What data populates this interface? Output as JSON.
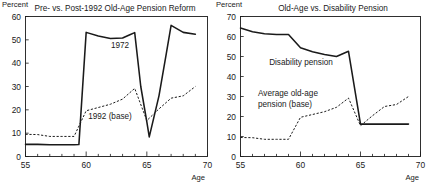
{
  "figure": {
    "ylabel_left": "Percent",
    "ylabel_right": "Percent",
    "xlabel_left": "Age",
    "xlabel_right": "Age"
  },
  "chart_data": [
    {
      "type": "line",
      "title": "Pre- vs. Post-1992 Old-Age Pension Reform",
      "xlabel": "Age",
      "ylabel": "Percent",
      "xlim": [
        55,
        70
      ],
      "ylim": [
        0,
        60
      ],
      "xticks": [
        55,
        60,
        65,
        70
      ],
      "xtick_labels": [
        "55",
        "60",
        "65",
        "70"
      ],
      "xminor_step": 1,
      "yticks": [
        0,
        10,
        20,
        30,
        40,
        50,
        60
      ],
      "ytick_labels": [
        "0",
        "10",
        "20",
        "30",
        "40",
        "50",
        "60"
      ],
      "grid": false,
      "legend_position": "inline-annotation",
      "series": [
        {
          "name": "1972",
          "style": "dashed",
          "label_text": "1972",
          "x": [
            55,
            56,
            57,
            58,
            59,
            59.4,
            60,
            61,
            62,
            63,
            63.6,
            64,
            64.5,
            65,
            65.2,
            66,
            66.6,
            67,
            68,
            69
          ],
          "values": [
            5.2,
            5.2,
            5.0,
            5.0,
            5.0,
            5.1,
            53.2,
            51.6,
            50.6,
            50.8,
            52.2,
            53.1,
            30.0,
            14.8,
            8.4,
            26.0,
            44.0,
            56.2,
            53.2,
            52.4
          ]
        },
        {
          "name": "1992 (base)",
          "style": "solid",
          "label_text": "1992 (base)",
          "x": [
            55,
            56,
            57,
            58,
            59,
            60,
            61,
            62,
            63,
            64,
            65,
            66,
            67,
            68,
            69
          ],
          "values": [
            9.5,
            9.4,
            8.6,
            8.6,
            8.6,
            19.6,
            21.0,
            22.4,
            24.6,
            29.2,
            15.4,
            20.4,
            25.0,
            26.0,
            30.0
          ]
        }
      ]
    },
    {
      "type": "line",
      "title": "Old-Age vs. Disability Pension",
      "xlabel": "Age",
      "ylabel": "Percent",
      "xlim": [
        55,
        70
      ],
      "ylim": [
        0,
        70
      ],
      "xticks": [
        55,
        60,
        65,
        70
      ],
      "xtick_labels": [
        "55",
        "60",
        "65",
        "70"
      ],
      "xminor_step": 1,
      "yticks": [
        0,
        10,
        20,
        30,
        40,
        50,
        60,
        70
      ],
      "ytick_labels": [
        "0",
        "10",
        "20",
        "30",
        "40",
        "50",
        "60",
        "70"
      ],
      "grid": false,
      "legend_position": "inline-annotation",
      "series": [
        {
          "name": "Disability pension",
          "style": "dashed",
          "label_text": "Disability pension",
          "x": [
            55,
            56,
            57,
            58,
            59,
            60,
            61,
            62,
            63,
            64,
            65,
            66,
            67,
            68,
            69
          ],
          "values": [
            64.2,
            62.4,
            61.4,
            61.0,
            61.0,
            54.4,
            52.4,
            51.0,
            50.0,
            52.6,
            16.2,
            16.2,
            16.2,
            16.2,
            16.2
          ]
        },
        {
          "name": "Average old-age pension (base)",
          "style": "solid",
          "label_line1": "Average old-age",
          "label_line2": "pension (base)",
          "x": [
            55,
            56,
            57,
            58,
            59,
            60,
            61,
            62,
            63,
            64,
            65,
            66,
            67,
            68,
            69
          ],
          "values": [
            9.5,
            9.4,
            8.6,
            8.6,
            8.6,
            19.6,
            21.0,
            22.4,
            24.6,
            29.2,
            15.4,
            20.4,
            25.0,
            26.0,
            30.0
          ]
        }
      ]
    }
  ]
}
